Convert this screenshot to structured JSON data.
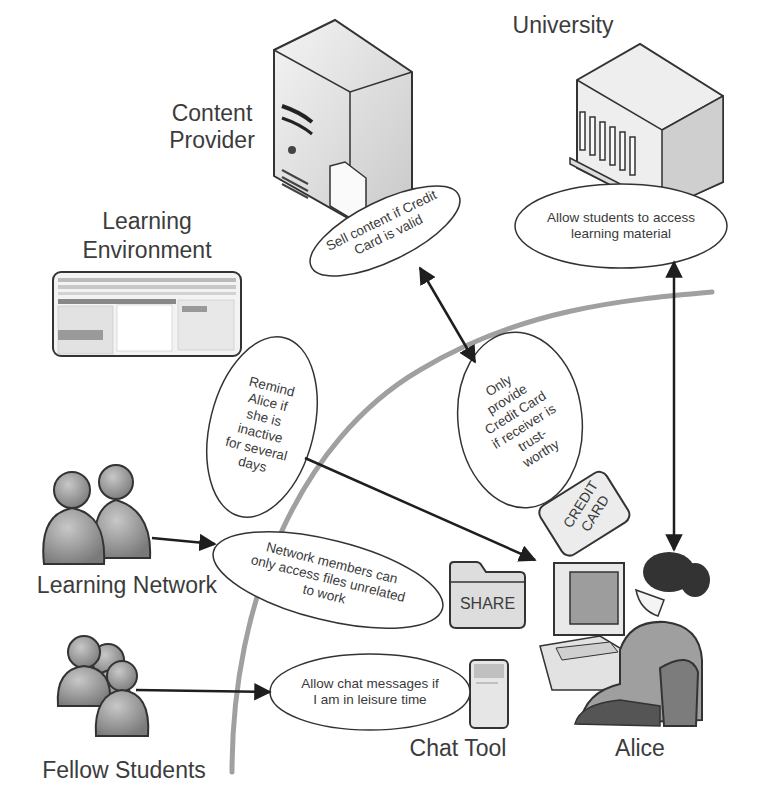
{
  "diagram": {
    "type": "privacy-policy-context-diagram",
    "central_actor": "Alice",
    "actors": [
      {
        "id": "content-provider",
        "label": "Content\nProvider",
        "icon": "server-icon"
      },
      {
        "id": "university",
        "label": "University",
        "icon": "building-icon"
      },
      {
        "id": "learning-environment",
        "label": "Learning\nEnvironment",
        "icon": "app-window-icon"
      },
      {
        "id": "learning-network",
        "label": "Learning Network",
        "icon": "people-group-icon"
      },
      {
        "id": "fellow-students",
        "label": "Fellow Students",
        "icon": "people-group-icon"
      },
      {
        "id": "chat-tool",
        "label": "Chat Tool",
        "icon": "chat-device-icon"
      },
      {
        "id": "alice",
        "label": "Alice",
        "icon": "user-at-computer-icon"
      }
    ],
    "policies": [
      {
        "id": "p-content",
        "text": "Sell content if Credit\nCard is valid",
        "between": [
          "content-provider",
          "alice"
        ]
      },
      {
        "id": "p-university",
        "text": "Allow students to access\nlearning material",
        "between": [
          "university",
          "alice"
        ]
      },
      {
        "id": "p-remind",
        "text": "Remind\nAlice if\nshe is\ninactive\nfor several\ndays",
        "between": [
          "learning-environment",
          "alice"
        ]
      },
      {
        "id": "p-credit",
        "text": "Only\nprovide\nCredit Card\nif receiver is\ntrust-\nworthy",
        "between": [
          "alice",
          "content-provider"
        ]
      },
      {
        "id": "p-network",
        "text": "Network members can\nonly access files unrelated\nto work",
        "between": [
          "learning-network",
          "alice"
        ]
      },
      {
        "id": "p-chat",
        "text": "Allow chat messages if\nI am in leisure time",
        "between": [
          "fellow-students",
          "chat-tool"
        ]
      }
    ],
    "objects": [
      {
        "id": "credit-card",
        "label": "CREDIT\nCARD"
      },
      {
        "id": "share-folder",
        "label": "SHARE"
      }
    ],
    "colors": {
      "line": "#2a2a2a",
      "boundary_arc": "#9a9a9a",
      "text": "#3a3a3a",
      "icon_fill": "#8c8c8c"
    }
  },
  "labels": {
    "content_provider": "Content\nProvider",
    "university": "University",
    "learning_environment_1": "Learning",
    "learning_environment_2": "Environment",
    "learning_network": "Learning Network",
    "fellow_students": "Fellow Students",
    "chat_tool": "Chat Tool",
    "alice": "Alice",
    "credit_card_1": "CREDIT",
    "credit_card_2": "CARD",
    "share": "SHARE"
  },
  "bubbles": {
    "content": "Sell content if Credit\nCard is valid",
    "university": "Allow students to access\nlearning material",
    "remind": "Remind\nAlice if\nshe is\ninactive\nfor several\ndays",
    "credit": "Only\nprovide\nCredit Card\nif receiver is\ntrust-\nworthy",
    "network": "Network members can\nonly access files unrelated\nto work",
    "chat": "Allow chat messages if\nI am in leisure time"
  }
}
